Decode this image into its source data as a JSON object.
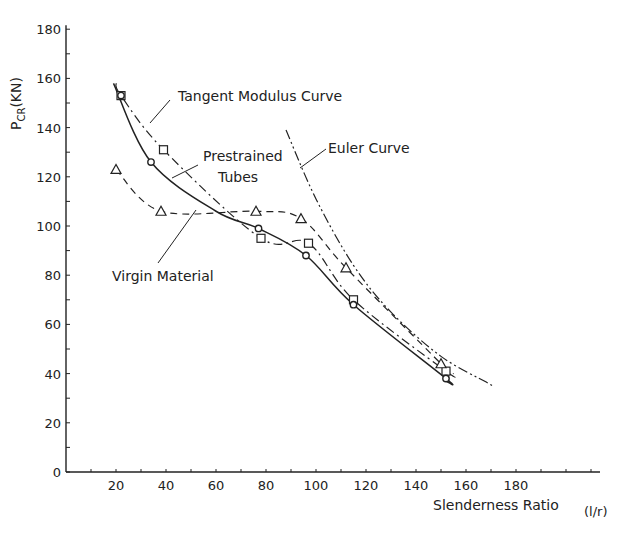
{
  "chart_data": {
    "type": "line",
    "title": "",
    "xlabel": "Slenderness Ratio",
    "xlabel_unit": "(l/r)",
    "ylabel": "P_CR (KN)",
    "ylabel_main": "P",
    "ylabel_sub": "CR",
    "ylabel_unit": "(KN)",
    "xlim": [
      0,
      200
    ],
    "ylim": [
      0,
      180
    ],
    "x_ticks": [
      20,
      40,
      60,
      80,
      100,
      120,
      140,
      160,
      180
    ],
    "y_ticks": [
      0,
      20,
      40,
      60,
      80,
      100,
      120,
      140,
      160,
      180
    ],
    "grid": false,
    "legend": "none (curves labeled by annotations)",
    "annotations": [
      {
        "text": "Tangent Modulus Curve",
        "points_to": "Tangent Modulus Curve"
      },
      {
        "text": "Prestrained Tubes",
        "points_to": "Prestrained Tubes"
      },
      {
        "text": "Euler Curve",
        "points_to": "Euler Curve"
      },
      {
        "text": "Virgin Material",
        "points_to": "Virgin Material"
      }
    ],
    "series": [
      {
        "name": "Tangent Modulus Curve",
        "style": "dash-dot",
        "marker": "square",
        "x": [
          22,
          39,
          78,
          97,
          115,
          152
        ],
        "y": [
          153,
          131,
          95,
          93,
          70,
          41
        ]
      },
      {
        "name": "Prestrained Tubes",
        "style": "solid",
        "marker": "circle",
        "x": [
          22,
          34,
          60,
          77,
          96,
          115,
          152
        ],
        "y": [
          153,
          126,
          106,
          99,
          88,
          68,
          38
        ]
      },
      {
        "name": "Virgin Material",
        "style": "dashed",
        "marker": "triangle",
        "x": [
          20,
          38,
          76,
          94,
          112,
          150
        ],
        "y": [
          123,
          106,
          106,
          103,
          83,
          44
        ]
      },
      {
        "name": "Euler Curve",
        "style": "dash-dot-dot",
        "marker": "none",
        "x": [
          88,
          100,
          115,
          130,
          150,
          169
        ],
        "y": [
          139,
          111,
          84,
          65,
          47,
          36
        ]
      }
    ]
  },
  "labels": {
    "tangent": "Tangent Modulus Curve",
    "prestrained_1": "Prestrained",
    "prestrained_2": "Tubes",
    "euler": "Euler Curve",
    "virgin": "Virgin Material"
  }
}
